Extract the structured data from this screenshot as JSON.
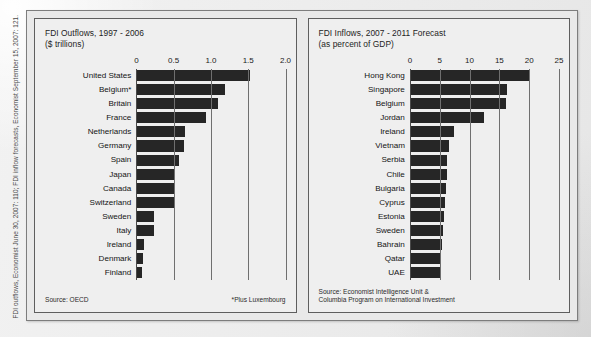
{
  "citation": "FDI outflows, Economist June 30, 2007: 110; FDI inflow forecasts, Economist September 15, 2007: 121.",
  "colors": {
    "bar": "#262626",
    "panel_background": "#efefef",
    "frame_background": "#e9e9e9",
    "gridline": "#6f6f6f",
    "text": "#141414"
  },
  "panels": [
    {
      "id": "fdi-outflows",
      "title": "FDI Outflows, 1997 - 2006\n($ trillions)",
      "source": "Source: OECD",
      "footnote": "*Plus Luxembourg",
      "chart_data": {
        "type": "bar",
        "orientation": "horizontal",
        "title": "FDI Outflows, 1997 - 2006",
        "subtitle": "($ trillions)",
        "xlabel": "$ trillions",
        "ylabel": "",
        "xlim": [
          0,
          2.0
        ],
        "xticks": [
          0,
          0.5,
          1.0,
          1.5,
          2.0
        ],
        "xtick_labels": [
          "0",
          "0.5",
          "1.0",
          "1.5",
          "2.0"
        ],
        "grid": true,
        "legend": "none",
        "categories": [
          "United States",
          "Belgium*",
          "Britain",
          "France",
          "Netherlands",
          "Germany",
          "Spain",
          "Japan",
          "Canada",
          "Switzerland",
          "Sweden",
          "Italy",
          "Ireland",
          "Denmark",
          "Finland"
        ],
        "values": [
          1.52,
          1.19,
          1.09,
          0.93,
          0.65,
          0.64,
          0.57,
          0.51,
          0.5,
          0.51,
          0.23,
          0.23,
          0.1,
          0.09,
          0.07
        ]
      }
    },
    {
      "id": "fdi-inflows",
      "title": "FDI Inflows, 2007 - 2011 Forecast\n(as percent of GDP)",
      "source": "Source: Economist Intelligence Unit &\nColumbia Program on International Investment",
      "footnote": "",
      "chart_data": {
        "type": "bar",
        "orientation": "horizontal",
        "title": "FDI Inflows, 2007 - 2011 Forecast",
        "subtitle": "(as percent of GDP)",
        "xlabel": "percent of GDP",
        "ylabel": "",
        "xlim": [
          0,
          25
        ],
        "xticks": [
          0,
          5,
          10,
          15,
          20,
          25
        ],
        "xtick_labels": [
          "0",
          "5",
          "10",
          "15",
          "20",
          "25"
        ],
        "grid": true,
        "legend": "none",
        "categories": [
          "Hong Kong",
          "Singapore",
          "Belgium",
          "Jordan",
          "Ireland",
          "Vietnam",
          "Serbia",
          "Chile",
          "Bulgaria",
          "Cyprus",
          "Estonia",
          "Sweden",
          "Bahrain",
          "Qatar",
          "UAE"
        ],
        "values": [
          20.2,
          16.2,
          16.1,
          12.4,
          7.4,
          6.6,
          6.2,
          6.2,
          6.1,
          5.9,
          5.8,
          5.6,
          5.4,
          5.1,
          5.1
        ]
      }
    }
  ]
}
